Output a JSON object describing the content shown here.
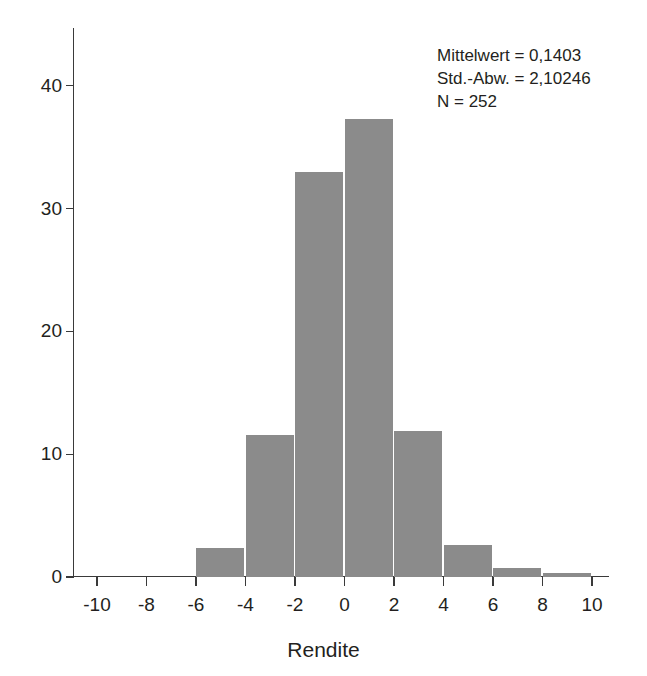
{
  "chart_data": {
    "type": "bar",
    "title": "",
    "subtitle": "",
    "xlabel": "Rendite",
    "ylabel": "",
    "xlim": [
      -11,
      11
    ],
    "ylim": [
      0,
      45
    ],
    "grid": false,
    "legend_position": "top-right",
    "bin_width": 2,
    "x_ticks": [
      "-10",
      "-8",
      "-6",
      "-4",
      "-2",
      "0",
      "2",
      "4",
      "6",
      "8",
      "10"
    ],
    "x_tick_values": [
      -10,
      -8,
      -6,
      -4,
      -2,
      0,
      2,
      4,
      6,
      8,
      10
    ],
    "y_ticks": [
      "0",
      "10",
      "20",
      "30",
      "40"
    ],
    "y_tick_values": [
      0,
      10,
      20,
      30,
      40
    ],
    "bar_color": "#8b8b8b",
    "axis_color": "#3a3a3a",
    "text_color": "#231f20",
    "bins": [
      {
        "from": -6,
        "to": -4,
        "value": 2.4
      },
      {
        "from": -4,
        "to": -2,
        "value": 11.6
      },
      {
        "from": -2,
        "to": 0,
        "value": 33.0
      },
      {
        "from": 0,
        "to": 2,
        "value": 37.3
      },
      {
        "from": 2,
        "to": 4,
        "value": 11.9
      },
      {
        "from": 4,
        "to": 6,
        "value": 2.6
      },
      {
        "from": 6,
        "to": 8,
        "value": 0.7
      },
      {
        "from": 8,
        "to": 10,
        "value": 0.3
      }
    ],
    "categories": [
      "-6 to -4",
      "-4 to -2",
      "-2 to 0",
      "0 to 2",
      "2 to 4",
      "4 to 6",
      "6 to 8",
      "8 to 10"
    ],
    "values": [
      2.4,
      11.6,
      33.0,
      37.3,
      11.9,
      2.6,
      0.7,
      0.3
    ],
    "annotations": {
      "mean_label": "Mittelwert = 0,1403",
      "std_label": "Std.-Abw. = 2,10246",
      "n_label": "N = 252"
    }
  }
}
